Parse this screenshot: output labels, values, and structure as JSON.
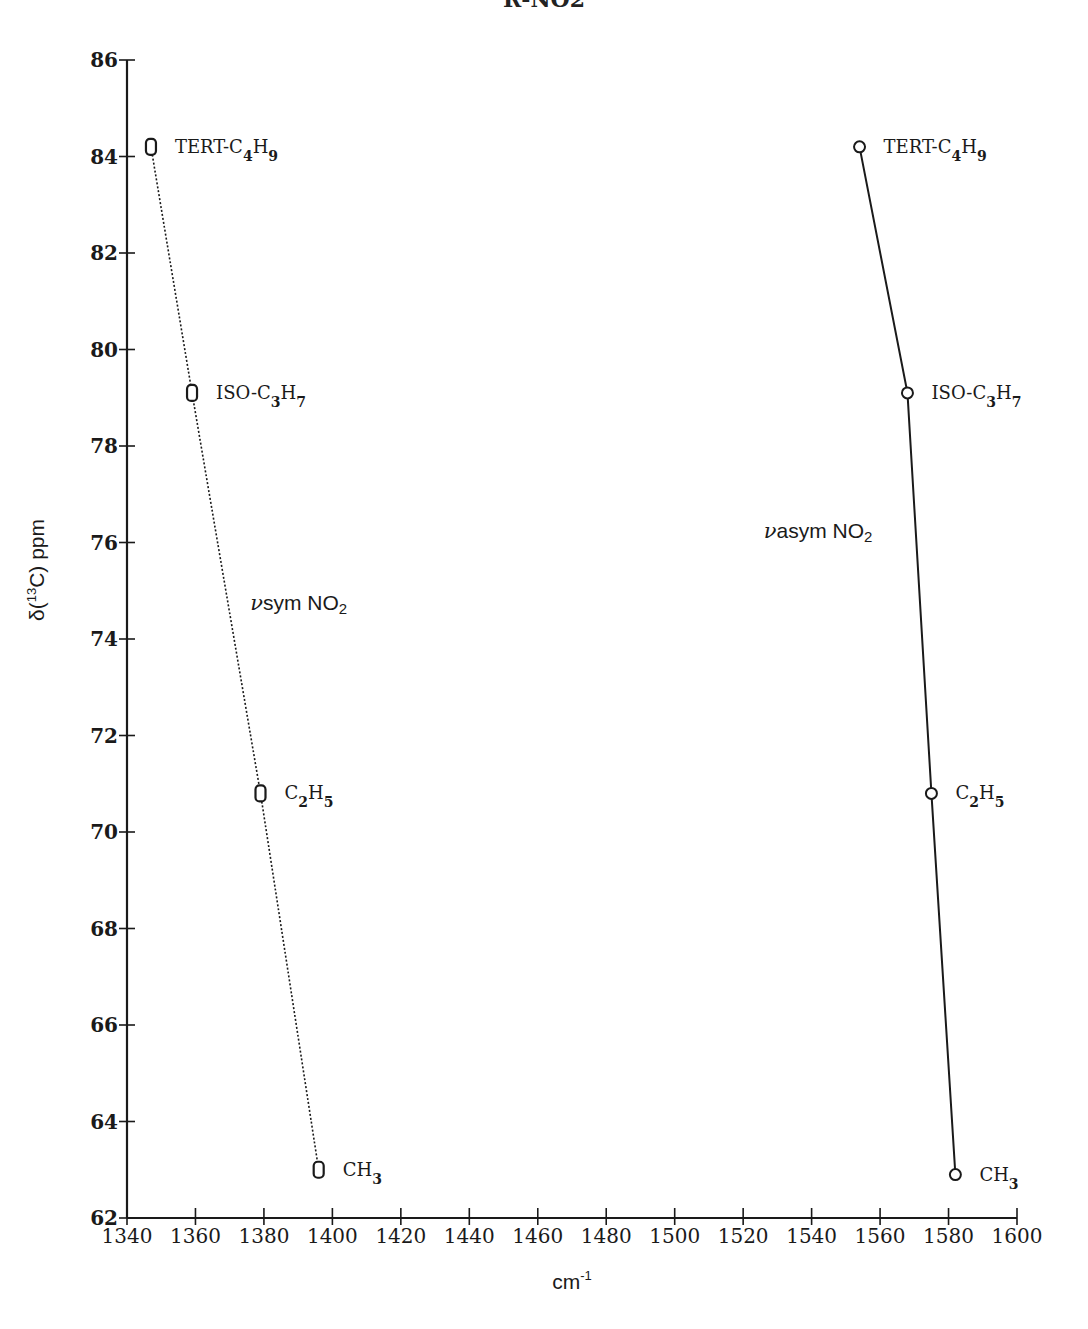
{
  "chart_data": {
    "type": "line",
    "title": "R-NO2",
    "xlabel": "cm-1",
    "ylabel": "δ(13C) ppm",
    "xlim": [
      1340,
      1600
    ],
    "ylim": [
      62,
      86
    ],
    "grid": false,
    "x_ticks": [
      1340,
      1360,
      1380,
      1400,
      1420,
      1440,
      1460,
      1480,
      1500,
      1520,
      1540,
      1560,
      1580,
      1600
    ],
    "y_ticks": [
      62,
      64,
      66,
      68,
      70,
      72,
      74,
      76,
      78,
      80,
      82,
      84,
      86
    ],
    "series": [
      {
        "name": "νsym NO2",
        "line_style": "dotted",
        "marker": "open-rounded-rect",
        "points": [
          {
            "label": "TERT-C4H9",
            "base": "TERT-C",
            "sub1": "4",
            "mid": "H",
            "sub2": "9",
            "x": 1347,
            "y": 84.2
          },
          {
            "label": "ISO-C3H7",
            "base": "ISO-C",
            "sub1": "3",
            "mid": "H",
            "sub2": "7",
            "x": 1359,
            "y": 79.1
          },
          {
            "label": "C2H5",
            "base": "C",
            "sub1": "2",
            "mid": "H",
            "sub2": "5",
            "x": 1379,
            "y": 70.8
          },
          {
            "label": "CH3",
            "base": "CH",
            "sub1": "3",
            "mid": "",
            "sub2": "",
            "x": 1396,
            "y": 63.0
          }
        ]
      },
      {
        "name": "νasym NO2",
        "line_style": "solid",
        "marker": "open-circle",
        "points": [
          {
            "label": "TERT-C4H9",
            "base": "TERT-C",
            "sub1": "4",
            "mid": "H",
            "sub2": "9",
            "x": 1554,
            "y": 84.2
          },
          {
            "label": "ISO-C3H7",
            "base": "ISO-C",
            "sub1": "3",
            "mid": "H",
            "sub2": "7",
            "x": 1568,
            "y": 79.1
          },
          {
            "label": "C2H5",
            "base": "C",
            "sub1": "2",
            "mid": "H",
            "sub2": "5",
            "x": 1575,
            "y": 70.8
          },
          {
            "label": "CH3",
            "base": "CH",
            "sub1": "3",
            "mid": "",
            "sub2": "",
            "x": 1582,
            "y": 62.9
          }
        ]
      }
    ],
    "annotations": [
      {
        "text_prefix": "ν",
        "text": "sym NO",
        "sub": "2",
        "x": 1376,
        "y": 74.6
      },
      {
        "text_prefix": "ν",
        "text": "asym NO",
        "sub": "2",
        "x": 1526,
        "y": 76.1
      }
    ]
  },
  "labels": {
    "title": "R-NO2",
    "xlabel_base": "cm",
    "xlabel_sup": "-1",
    "ylabel_prefix": "δ(",
    "ylabel_sup": "13",
    "ylabel_suffix": "C) ppm"
  },
  "colors": {
    "ink": "#1a1a1a",
    "background": "#ffffff"
  }
}
